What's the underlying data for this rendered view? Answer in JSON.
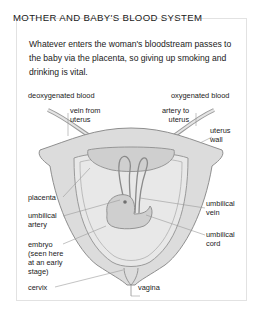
{
  "figure": {
    "title": "MOTHER AND BABY'S BLOOD SYSTEM",
    "intro": "Whatever enters the woman's bloodstream passes to the baby via the placenta, so giving up smoking and drinking is vital.",
    "labels": {
      "deoxygenated": "deoxygenated blood",
      "oxygenated": "oxygenated blood",
      "vein_from_uterus": "vein from\nuterus",
      "artery_to_uterus": "artery to\nuterus",
      "uterus_wall": "uterus\nwall",
      "placenta": "placenta",
      "umbilical_artery": "umbilical\nartery",
      "umbilical_vein": "umbilical\nvein",
      "umbilical_cord": "umbilical\ncord",
      "embryo": "embryo\n(seen here\nat an early\nstage)",
      "cervix": "cervix",
      "vagina": "vagina"
    },
    "colors": {
      "uterus_fill": "#d9d9d9",
      "cavity_fill": "#e6e6e6",
      "line": "#8a8a8a",
      "text": "#1a1a1a"
    }
  }
}
